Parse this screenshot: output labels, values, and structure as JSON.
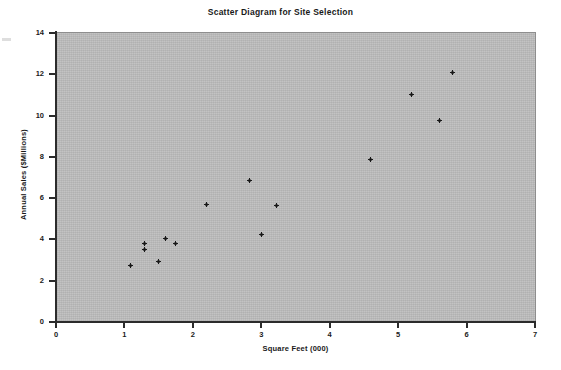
{
  "chart_data": {
    "type": "scatter",
    "title": "Scatter Diagram for Site Selection",
    "xlabel": "Square Feet (000)",
    "ylabel": "Annual Sales ($Millions)",
    "xlim": [
      0,
      7
    ],
    "ylim": [
      0,
      14
    ],
    "xticks": [
      "0",
      "1",
      "2",
      "3",
      "4",
      "5",
      "6",
      "7"
    ],
    "yticks": [
      "0",
      "2",
      "4",
      "6",
      "8",
      "10",
      "12",
      "14"
    ],
    "xtick_values": [
      0,
      1,
      2,
      3,
      4,
      5,
      6,
      7
    ],
    "ytick_values": [
      0,
      2,
      4,
      6,
      8,
      10,
      12,
      14
    ],
    "grid": false,
    "legend": false,
    "marker": "small-black-dot",
    "plot_background": "#bdbdbd",
    "marker_color": "#181818",
    "axis_color": "#2b2b2b",
    "series": [
      {
        "name": "Sites",
        "points": [
          {
            "x": 1.09,
            "y": 2.75
          },
          {
            "x": 1.3,
            "y": 3.8
          },
          {
            "x": 1.3,
            "y": 3.5
          },
          {
            "x": 1.5,
            "y": 2.95
          },
          {
            "x": 1.6,
            "y": 4.05
          },
          {
            "x": 1.75,
            "y": 3.8
          },
          {
            "x": 2.2,
            "y": 5.7
          },
          {
            "x": 2.83,
            "y": 6.85
          },
          {
            "x": 3.0,
            "y": 4.25
          },
          {
            "x": 3.22,
            "y": 5.65
          },
          {
            "x": 4.6,
            "y": 7.85
          },
          {
            "x": 5.2,
            "y": 11.0
          },
          {
            "x": 5.6,
            "y": 9.75
          },
          {
            "x": 5.8,
            "y": 12.1
          }
        ]
      }
    ]
  }
}
